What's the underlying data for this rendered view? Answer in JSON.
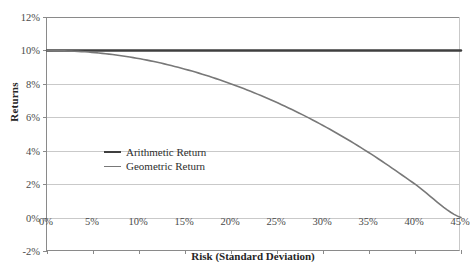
{
  "chart_data": {
    "type": "line",
    "title": "",
    "xlabel": "Risk (Standard Deviation)",
    "ylabel": "Returns",
    "xlim": [
      0,
      45
    ],
    "ylim": [
      -2,
      12
    ],
    "grid": true,
    "legend_position": "inside-left",
    "x_tick_labels": [
      "0%",
      "5%",
      "10%",
      "15%",
      "20%",
      "25%",
      "30%",
      "35%",
      "40%",
      "45%"
    ],
    "x_tick_values": [
      0,
      5,
      10,
      15,
      20,
      25,
      30,
      35,
      40,
      45
    ],
    "y_tick_labels": [
      "-2%",
      "0%",
      "2%",
      "4%",
      "6%",
      "8%",
      "10%",
      "12%"
    ],
    "y_tick_values": [
      -2,
      0,
      2,
      4,
      6,
      8,
      10,
      12
    ],
    "x": [
      0,
      5,
      10,
      15,
      20,
      25,
      30,
      35,
      40,
      45
    ],
    "series": [
      {
        "name": "Arithmetic Return",
        "color": "#3f3f3f",
        "width": 2.4,
        "values": [
          10,
          10,
          10,
          10,
          10,
          10,
          10,
          10,
          10,
          10
        ]
      },
      {
        "name": "Geometric Return",
        "color": "#787878",
        "width": 1.6,
        "values": [
          10,
          9.88,
          9.51,
          8.88,
          8.0,
          6.88,
          5.51,
          3.88,
          2.0,
          0.0
        ]
      }
    ],
    "annotations": []
  },
  "legend": {
    "items": [
      {
        "label": "Arithmetic Return"
      },
      {
        "label": "Geometric Return"
      }
    ]
  }
}
